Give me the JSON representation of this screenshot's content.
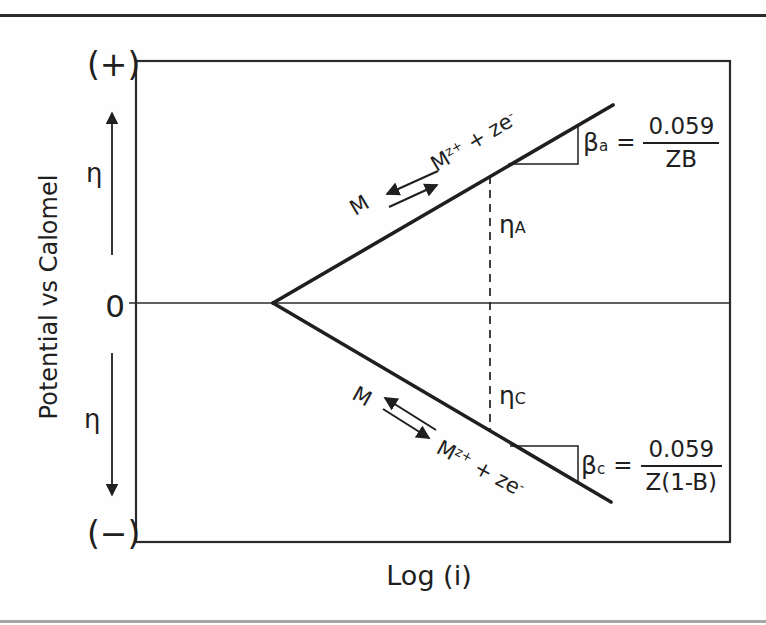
{
  "figure": {
    "y_axis": {
      "label": "Potential vs Calomel",
      "positive_symbol": "(+)",
      "negative_symbol": "(−)",
      "zero_label": "0",
      "eta_upper": "η",
      "eta_lower": "η"
    },
    "x_axis": {
      "label": "Log (i)"
    },
    "anodic_branch": {
      "reactant": "M",
      "product": {
        "base": "M",
        "sup1": "z+",
        "mid": " + ze",
        "sup2": "-"
      },
      "overpotential": {
        "symbol": "η",
        "subscript": "A"
      },
      "tafel_slope": {
        "symbol": "β",
        "subscript": "a",
        "equals": "=",
        "numerator": "0.059",
        "denominator": "ZB"
      }
    },
    "cathodic_branch": {
      "reactant": "M",
      "product": {
        "base": "M",
        "sup1": "z+",
        "mid": " + ze",
        "sup2": "-"
      },
      "overpotential": {
        "symbol": "η",
        "subscript": "C"
      },
      "tafel_slope": {
        "symbol": "β",
        "subscript": "c",
        "equals": "=",
        "numerator": "0.059",
        "denominator": "Z(1-B)"
      }
    },
    "colors": {
      "ink": "#1f1f1f",
      "frame": "#2b2b2b",
      "rule_top": "#2b2b2b",
      "rule_bottom": "#a6a6a6"
    }
  }
}
